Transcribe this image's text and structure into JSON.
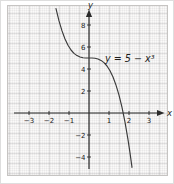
{
  "figure": {
    "equation": "y = 5 − x³",
    "x_axis_label": "x",
    "y_axis_label": "y"
  },
  "chart_data": {
    "type": "line",
    "title": "",
    "equation": "y = 5 − x³",
    "xlabel": "x",
    "ylabel": "y",
    "xlim": [
      -4.1,
      4.0
    ],
    "ylim": [
      -5.3,
      9.8
    ],
    "x_ticks": [
      -3,
      -2,
      -1,
      1,
      2,
      3
    ],
    "y_ticks": [
      8,
      6,
      4,
      2,
      -2,
      -4
    ],
    "grid": true,
    "grid_style": "graph-paper: minor 0.1 unit, medium 0.5 unit",
    "legend_position": "none",
    "series": [
      {
        "name": "y = 5 − x³",
        "x": [
          -1.65,
          -1.5,
          -1.35,
          -1.2,
          -1.05,
          -0.9,
          -0.75,
          -0.6,
          -0.45,
          -0.3,
          -0.15,
          0,
          0.15,
          0.3,
          0.45,
          0.6,
          0.75,
          0.9,
          1.05,
          1.2,
          1.35,
          1.5,
          1.65,
          1.8,
          1.95,
          2.05,
          2.15
        ],
        "y": [
          9.492,
          8.375,
          7.46,
          6.728,
          6.158,
          5.729,
          5.422,
          5.216,
          5.091,
          5.027,
          5.003,
          5,
          4.997,
          4.973,
          4.909,
          4.784,
          4.578,
          4.271,
          3.842,
          3.272,
          2.54,
          1.625,
          0.508,
          -0.832,
          -2.415,
          -3.615,
          -4.938
        ]
      }
    ],
    "colors": {
      "curve": "#3a3a3a",
      "axis": "#2a2a2a",
      "tick_label": "#222222",
      "grid_medium": "#d8d6d4",
      "grid_minor": "#eceae9",
      "paper_bg": "#fbfaf9"
    }
  }
}
